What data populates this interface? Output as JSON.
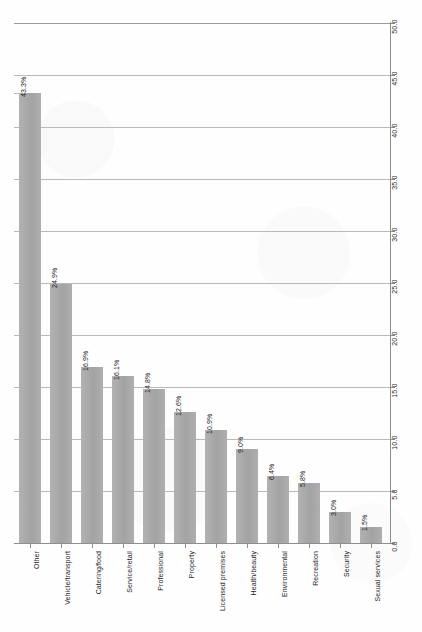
{
  "chart_data": {
    "type": "bar",
    "title": "",
    "subtitle": "",
    "xlabel": "",
    "ylabel": "",
    "orientation": "vertical",
    "grid": true,
    "legend": false,
    "legend_position": "none",
    "value_axis_position": "right",
    "value_axis_labels_rotated": true,
    "category_labels_rotated": true,
    "ylim": [
      0.0,
      50.0
    ],
    "ytick_step": 5.0,
    "yticks": [
      "0.0",
      "5.0",
      "10.0",
      "15.0",
      "20.0",
      "25.0",
      "30.0",
      "35.0",
      "40.0",
      "45.0",
      "50.0"
    ],
    "ytick_values": [
      0.0,
      5.0,
      10.0,
      15.0,
      20.0,
      25.0,
      30.0,
      35.0,
      40.0,
      45.0,
      50.0
    ],
    "categories": [
      "Other",
      "Vehicle/transport",
      "Catering/food",
      "Service/retail",
      "Professional",
      "Property",
      "Licensed premises",
      "Health/beauty",
      "Environmental",
      "Recreation",
      "Security",
      "Sexual services"
    ],
    "values": [
      43.3,
      24.9,
      16.9,
      16.1,
      14.8,
      12.6,
      10.9,
      9.0,
      6.4,
      5.8,
      3.0,
      1.5
    ],
    "data_labels": [
      "43.3%",
      "24.9%",
      "16.9%",
      "16.1%",
      "14.8%",
      "12.6%",
      "10.9%",
      "9.0%",
      "6.4%",
      "5.8%",
      "3.0%",
      "1.5%"
    ],
    "bar_color": "#a9a9a9",
    "gridline_color": "#b9b9b9",
    "axis_color": "#8a8a8a",
    "background_color": "#fefefe"
  }
}
